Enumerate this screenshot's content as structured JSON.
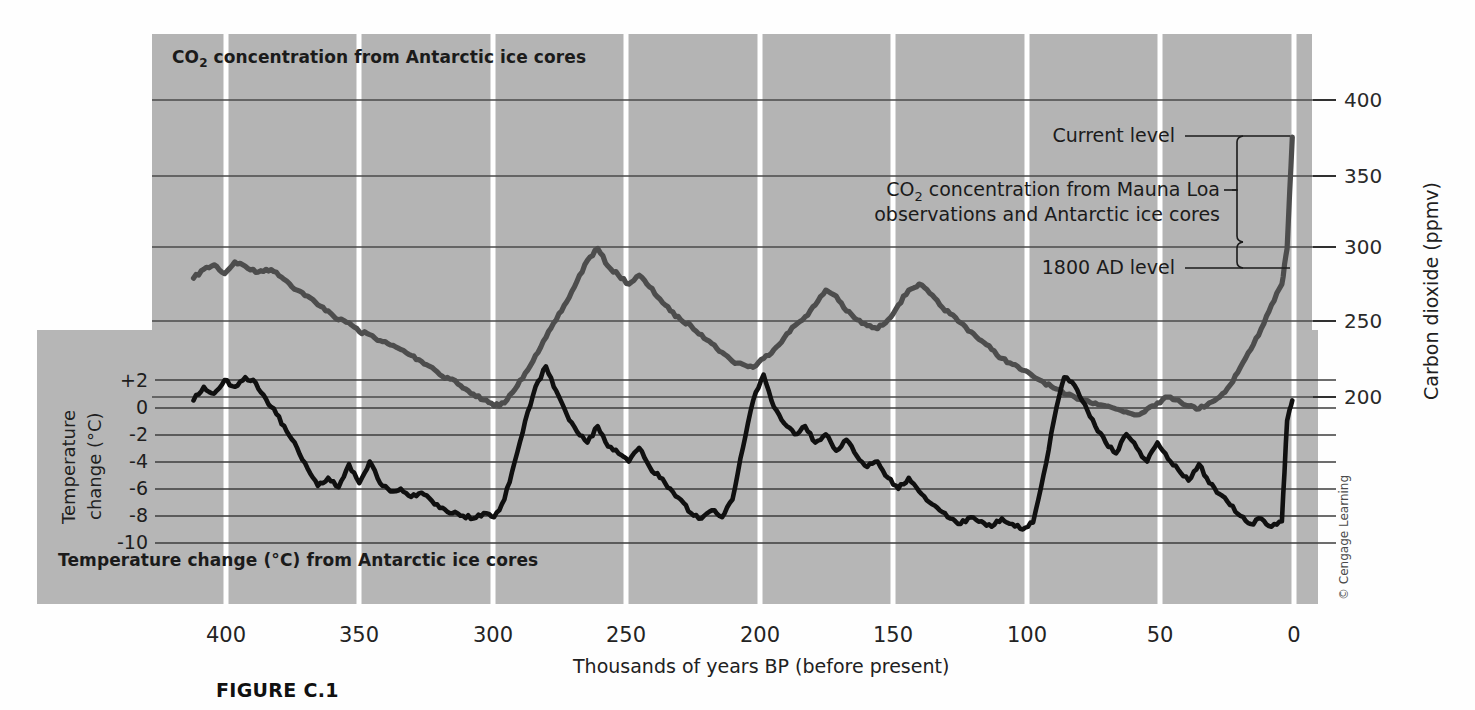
{
  "figure": {
    "caption": "FIGURE C.1",
    "credit": "© Cengage Learning"
  },
  "labels": {
    "co2_panel_title_pre": "CO",
    "co2_panel_title_sub": "2",
    "co2_panel_title_post": " concentration from Antarctic ice cores",
    "temp_panel_title": "Temperature change (°C) from Antarctic ice cores",
    "y_right_title": "Carbon dioxide (ppmv)",
    "y_left_title_line1": "Temperature",
    "y_left_title_line2": "change (°C)",
    "x_title": "Thousands of years BP (before present)"
  },
  "annotations": {
    "current_level": "Current level",
    "mauna_loa_pre": "CO",
    "mauna_loa_sub": "2",
    "mauna_loa_line1_post": " concentration from Mauna Loa",
    "mauna_loa_line2": "observations and Antarctic ice cores",
    "level_1800": "1800 AD level"
  },
  "colors": {
    "panel_background": "#b4b4b4",
    "co2_curve": "#4d4d4d",
    "temperature_curve": "#111111",
    "gridline": "#4a4a4a",
    "vertical_gridline": "#ffffff",
    "page_background": "#fefefe"
  },
  "chart_data": {
    "type": "line",
    "xlabel": "Thousands of years BP (before present)",
    "xlim": [
      440,
      -8
    ],
    "x_ticks": [
      400,
      350,
      300,
      250,
      200,
      150,
      100,
      50,
      0
    ],
    "grid": true,
    "legend": "none",
    "axes": [
      {
        "name": "carbon-dioxide",
        "position": "right",
        "label": "Carbon dioxide (ppmv)",
        "ticks": [
          400,
          350,
          300,
          250,
          200
        ],
        "lim": [
          180,
          410
        ],
        "units": "ppmv"
      },
      {
        "name": "temperature-change",
        "position": "left",
        "label": "Temperature change (°C)",
        "ticks": [
          "+2",
          "0",
          "-2",
          "-4",
          "-6",
          "-8",
          "-10"
        ],
        "lim": [
          -11,
          3
        ],
        "units": "°C"
      }
    ],
    "series": [
      {
        "name": "CO2 concentration from Antarctic ice cores",
        "axis": "carbon-dioxide",
        "color": "#4d4d4d",
        "units": "ppmv",
        "x": [
          424,
          420,
          416,
          412,
          408,
          404,
          400,
          396,
          392,
          388,
          384,
          380,
          376,
          372,
          368,
          364,
          360,
          356,
          352,
          348,
          344,
          340,
          336,
          332,
          328,
          324,
          320,
          316,
          312,
          308,
          304,
          300,
          296,
          292,
          288,
          284,
          280,
          276,
          272,
          268,
          264,
          260,
          256,
          252,
          248,
          244,
          240,
          236,
          232,
          228,
          224,
          220,
          216,
          212,
          208,
          204,
          200,
          196,
          192,
          188,
          184,
          180,
          176,
          172,
          168,
          164,
          160,
          156,
          152,
          148,
          144,
          140,
          136,
          132,
          128,
          124,
          120,
          116,
          112,
          108,
          104,
          100,
          96,
          92,
          88,
          84,
          80,
          76,
          72,
          68,
          64,
          60,
          56,
          52,
          48,
          44,
          40,
          36,
          32,
          28,
          24,
          20,
          16,
          12,
          8,
          4,
          2,
          0
        ],
        "y": [
          280,
          286,
          289,
          283,
          291,
          288,
          284,
          286,
          284,
          278,
          272,
          268,
          262,
          258,
          252,
          250,
          244,
          242,
          238,
          235,
          232,
          228,
          224,
          220,
          214,
          212,
          206,
          202,
          198,
          194,
          196,
          205,
          216,
          228,
          240,
          252,
          264,
          278,
          292,
          300,
          288,
          282,
          276,
          282,
          274,
          266,
          258,
          252,
          248,
          242,
          236,
          230,
          224,
          222,
          220,
          226,
          232,
          240,
          248,
          254,
          262,
          272,
          268,
          258,
          252,
          248,
          246,
          252,
          262,
          272,
          276,
          270,
          262,
          256,
          250,
          244,
          238,
          232,
          226,
          222,
          218,
          214,
          210,
          206,
          202,
          200,
          198,
          196,
          194,
          192,
          190,
          188,
          192,
          196,
          200,
          198,
          194,
          192,
          196,
          200,
          208,
          220,
          232,
          246,
          262,
          276,
          300,
          375
        ]
      },
      {
        "name": "Temperature change from Antarctic ice cores",
        "axis": "temperature-change",
        "color": "#111111",
        "units": "°C",
        "x": [
          424,
          420,
          416,
          412,
          408,
          404,
          400,
          396,
          392,
          388,
          384,
          380,
          376,
          372,
          368,
          364,
          360,
          356,
          352,
          348,
          344,
          340,
          336,
          332,
          328,
          324,
          320,
          316,
          312,
          308,
          304,
          300,
          296,
          292,
          288,
          284,
          280,
          276,
          272,
          268,
          264,
          260,
          256,
          252,
          248,
          244,
          240,
          236,
          232,
          228,
          224,
          220,
          216,
          212,
          208,
          204,
          200,
          196,
          192,
          188,
          184,
          180,
          176,
          172,
          168,
          164,
          160,
          156,
          152,
          148,
          144,
          140,
          136,
          132,
          128,
          124,
          120,
          116,
          112,
          108,
          104,
          100,
          96,
          92,
          88,
          84,
          80,
          76,
          72,
          68,
          64,
          60,
          56,
          52,
          48,
          44,
          40,
          36,
          32,
          28,
          24,
          20,
          16,
          12,
          8,
          4,
          2,
          0
        ],
        "y": [
          0.5,
          1.5,
          1.0,
          2.0,
          1.5,
          2.2,
          1.8,
          0.6,
          -0.5,
          -1.8,
          -3.0,
          -4.5,
          -5.8,
          -5.2,
          -5.9,
          -4.2,
          -5.6,
          -4.0,
          -5.6,
          -6.2,
          -6.0,
          -6.6,
          -6.3,
          -6.9,
          -7.4,
          -7.8,
          -8.0,
          -8.2,
          -7.8,
          -8.1,
          -6.8,
          -4.0,
          -1.0,
          1.5,
          3.0,
          1.2,
          -0.5,
          -1.8,
          -2.6,
          -1.4,
          -2.9,
          -3.4,
          -4.0,
          -3.0,
          -4.4,
          -5.2,
          -6.0,
          -6.8,
          -7.8,
          -8.2,
          -7.6,
          -8.1,
          -6.8,
          -3.0,
          0.5,
          2.4,
          0.0,
          -1.2,
          -2.0,
          -1.4,
          -2.6,
          -2.0,
          -3.2,
          -2.4,
          -3.6,
          -4.4,
          -4.0,
          -5.2,
          -6.0,
          -5.2,
          -6.2,
          -7.0,
          -7.6,
          -8.2,
          -8.6,
          -8.1,
          -8.4,
          -8.8,
          -8.2,
          -8.6,
          -9.0,
          -8.5,
          -5.0,
          -1.0,
          2.2,
          1.6,
          0.2,
          -1.4,
          -2.6,
          -3.4,
          -2.0,
          -3.0,
          -4.0,
          -2.6,
          -3.8,
          -4.6,
          -5.4,
          -4.2,
          -5.6,
          -6.4,
          -7.2,
          -8.0,
          -8.6,
          -8.2,
          -8.8,
          -8.4,
          -1.0,
          0.5
        ]
      }
    ],
    "annotations": [
      {
        "text": "Current level",
        "value": 375,
        "units": "ppmv"
      },
      {
        "text": "CO2 concentration from Mauna Loa observations and Antarctic ice cores",
        "range": [
          282,
          375
        ],
        "units": "ppmv"
      },
      {
        "text": "1800 AD level",
        "value": 282,
        "units": "ppmv"
      }
    ]
  }
}
